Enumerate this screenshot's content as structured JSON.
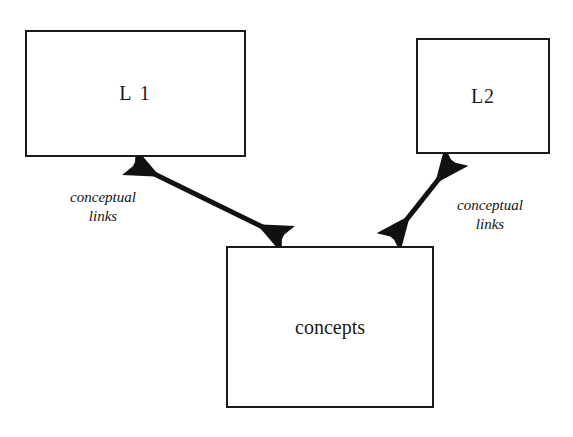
{
  "diagram": {
    "background_color": "#ffffff",
    "stroke_color": "#1a1a1a",
    "nodes": [
      {
        "id": "l1",
        "label": "L 1",
        "shape": "rectangle"
      },
      {
        "id": "l2",
        "label": "L2",
        "shape": "rectangle"
      },
      {
        "id": "concepts",
        "label": "concepts",
        "shape": "rectangle"
      }
    ],
    "edges": [
      {
        "id": "edge-l1-concepts",
        "from": "l1",
        "to": "concepts",
        "arrowheads": "both",
        "label_line1": "conceptual",
        "label_line2": "links"
      },
      {
        "id": "edge-l2-concepts",
        "from": "concepts",
        "to": "l2",
        "arrowheads": "both",
        "label_line1": "conceptual",
        "label_line2": "links"
      }
    ]
  }
}
